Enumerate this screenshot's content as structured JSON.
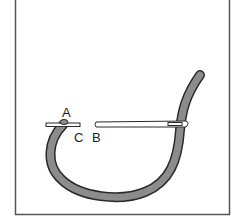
{
  "diagram": {
    "type": "stitch-illustration",
    "labels": {
      "a": "A",
      "b": "B",
      "c": "C"
    },
    "colors": {
      "frame": "#555555",
      "thread_fill": "#8c8c8c",
      "thread_outline": "#2a2a2a",
      "needle_fill": "#ffffff",
      "needle_outline": "#2a2a2a",
      "background": "#ffffff"
    }
  }
}
